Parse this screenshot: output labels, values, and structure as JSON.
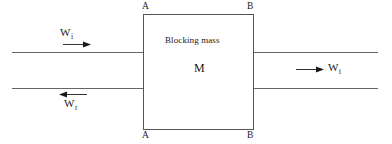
{
  "figure": {
    "background_color": "#ffffff",
    "line_color": "#666666",
    "box_border_color": "#555555",
    "text_color": "#1a1a1a"
  },
  "box": {
    "title": "Blocking mass",
    "symbol": "M",
    "corner_top_left": "A",
    "corner_top_right": "B",
    "corner_bottom_left": "A",
    "corner_bottom_right": "B"
  },
  "waves": {
    "incident": {
      "symbol": "W",
      "subscript": "i",
      "direction": "right"
    },
    "reflected": {
      "symbol": "W",
      "subscript": "r",
      "direction": "left"
    },
    "transmitted": {
      "symbol": "W",
      "subscript": "t",
      "direction": "right"
    }
  }
}
